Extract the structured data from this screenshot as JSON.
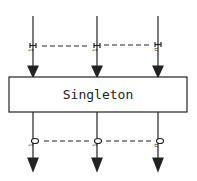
{
  "diagram": {
    "box_label": "Singleton",
    "inputs": [
      {
        "label": "I1",
        "x": 33
      },
      {
        "label": "I1",
        "x": 97
      },
      {
        "label": "In",
        "x": 158
      }
    ],
    "outputs": [
      {
        "label": "O1",
        "x": 33
      },
      {
        "label": "O1",
        "x": 97
      },
      {
        "label": "On",
        "x": 158
      }
    ],
    "colors": {
      "stroke": "#222222",
      "background": "#ffffff"
    }
  }
}
